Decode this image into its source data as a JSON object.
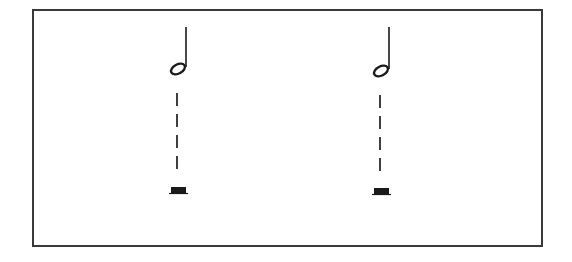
{
  "diagram": {
    "type": "music-notation-illustration",
    "frame": {
      "stroke": "#3a3a3a",
      "fill": "#ffffff"
    },
    "ink_color": "#1a1a1a",
    "columns": [
      {
        "id": "column-1",
        "note": {
          "type": "half-note",
          "stem": "up",
          "head_cx": 178,
          "head_cy": 69,
          "stem_x": 186,
          "stem_top": 27
        },
        "connector": {
          "style": "dashed-vertical",
          "x": 177,
          "dashes": [
            [
              93,
              106
            ],
            [
              114,
              127
            ],
            [
              135,
              148
            ],
            [
              156,
              169
            ]
          ]
        },
        "rest": {
          "type": "half-rest",
          "x": 170,
          "y": 187,
          "width": 17,
          "height": 7
        }
      },
      {
        "id": "column-2",
        "note": {
          "type": "half-note",
          "stem": "up",
          "head_cx": 381,
          "head_cy": 71,
          "stem_x": 389,
          "stem_top": 27
        },
        "connector": {
          "style": "dashed-vertical",
          "x": 380,
          "dashes": [
            [
              95,
              108
            ],
            [
              116,
              129
            ],
            [
              137,
              150
            ],
            [
              158,
              171
            ]
          ]
        },
        "rest": {
          "type": "half-rest",
          "x": 373,
          "y": 188,
          "width": 17,
          "height": 7
        }
      }
    ]
  }
}
